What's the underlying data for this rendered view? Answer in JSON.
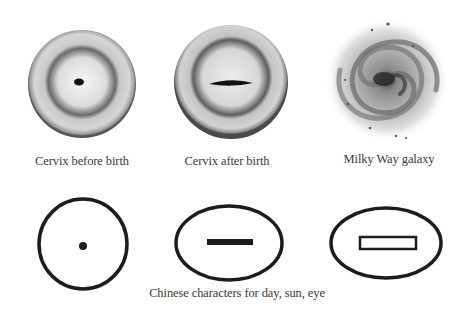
{
  "top_row": [
    {
      "id": "cervix-before",
      "caption": "Cervix before birth"
    },
    {
      "id": "cervix-after",
      "caption": "Cervix after birth"
    },
    {
      "id": "milky-way",
      "caption": "Milky Way galaxy"
    }
  ],
  "bottom_row": {
    "symbols": [
      {
        "id": "day-symbol",
        "shape": "circle-with-dot"
      },
      {
        "id": "sun-symbol",
        "shape": "oval-with-filled-bar"
      },
      {
        "id": "eye-symbol",
        "shape": "oval-with-hollow-bar"
      }
    ],
    "caption": "Chinese characters for day, sun, eye"
  },
  "colors": {
    "ink": "#1c1c1c",
    "caption": "#3a3a3a",
    "background": "#ffffff"
  }
}
